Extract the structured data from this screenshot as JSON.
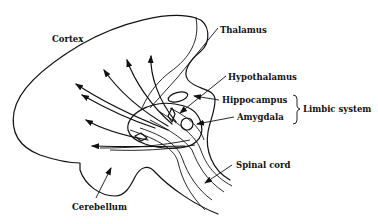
{
  "diagram": {
    "labels": {
      "cortex": "Cortex",
      "thalamus": "Thalamus",
      "hypothalamus": "Hypothalamus",
      "hippocampus": "Hippocampus",
      "amygdala": "Amygdala",
      "limbic_system": "Limbic system",
      "spinal_cord": "Spinal cord",
      "cerebellum": "Cerebellum"
    },
    "colors": {
      "ink": "#111111",
      "background": "#ffffff"
    }
  }
}
